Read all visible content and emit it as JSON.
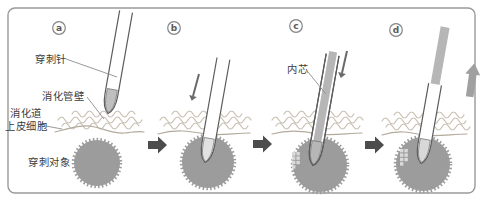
{
  "figure": {
    "panels": [
      {
        "badge": "a"
      },
      {
        "badge": "b"
      },
      {
        "badge": "c"
      },
      {
        "badge": "d"
      }
    ],
    "labels": {
      "needle": "穿刺针",
      "wall": "消化管壁",
      "epithelium_line1": "消化道",
      "epithelium_line2": "上皮细胞",
      "target": "穿刺对象",
      "stylet": "内芯"
    },
    "colors": {
      "border": "#9a9a9a",
      "target_fill": "#9c9c9c",
      "wave": "#c9c0b2",
      "membrane": "#b3aa9c",
      "needle_outline": "#5c5c5c",
      "tip_fill_a": "#bfbfbf",
      "tip_fill_b": "#e2e2e2",
      "tip_fill_d": "#d8d8d8",
      "stylet_fill": "#b6b6b6",
      "step_arrow": "#4c4c4c",
      "motion_arrow": "#6a6a6a",
      "up_arrow": "#a0a0a0",
      "sample_square": "#dadada",
      "label_text": "#3c3c3c"
    }
  }
}
